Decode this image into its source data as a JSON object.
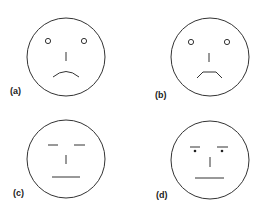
{
  "figure": {
    "panels": [
      {
        "id": "a",
        "label": "(a)",
        "expression": "sad, open round eyes, downturned mouth"
      },
      {
        "id": "b",
        "label": "(b)",
        "expression": "sad, open round eyes, trapezoid frown"
      },
      {
        "id": "c",
        "label": "(c)",
        "expression": "neutral, dash eyes, flat mouth"
      },
      {
        "id": "d",
        "label": "(d)",
        "expression": "stern, eyebrows with dot pupils, flat mouth"
      }
    ],
    "stroke_color": "#333333",
    "background": "#ffffff"
  }
}
